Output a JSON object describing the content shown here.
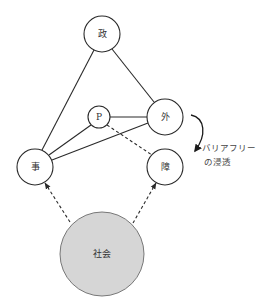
{
  "diagram": {
    "nodes": [
      {
        "id": "sei",
        "label": "政",
        "cx": 102,
        "cy": 34,
        "r": 18,
        "filled": false
      },
      {
        "id": "p",
        "label": "P",
        "cx": 99,
        "cy": 117,
        "r": 11,
        "filled": false
      },
      {
        "id": "gai",
        "label": "外",
        "cx": 165,
        "cy": 117,
        "r": 18,
        "filled": false
      },
      {
        "id": "ji",
        "label": "事",
        "cx": 35,
        "cy": 167,
        "r": 18,
        "filled": false
      },
      {
        "id": "sho",
        "label": "障",
        "cx": 165,
        "cy": 167,
        "r": 18,
        "filled": false
      },
      {
        "id": "shakai",
        "label": "社会",
        "cx": 102,
        "cy": 254,
        "r": 42,
        "filled": true
      }
    ],
    "edges": [
      {
        "from": "sei",
        "to": "ji",
        "style": "solid"
      },
      {
        "from": "sei",
        "to": "gai",
        "style": "solid"
      },
      {
        "from": "p",
        "to": "gai",
        "style": "solid"
      },
      {
        "from": "p",
        "to": "ji",
        "style": "solid"
      },
      {
        "from": "gai",
        "to": "ji",
        "style": "solid"
      },
      {
        "from": "p",
        "to": "sho",
        "style": "dashed"
      },
      {
        "from": "shakai",
        "to": "ji",
        "style": "dashed-arrow"
      },
      {
        "from": "shakai",
        "to": "sho",
        "style": "dashed-arrow"
      }
    ],
    "annotation": {
      "line1": "バリアフリー",
      "line2": "の浸透",
      "arrow": "curved-arrow from 外 toward 障"
    },
    "colors": {
      "line": "#2a2a2a",
      "society_fill": "#d6d6d6",
      "background": "#ffffff"
    }
  }
}
